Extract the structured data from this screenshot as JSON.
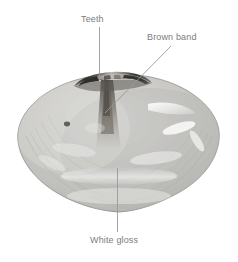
{
  "figure": {
    "background_color": "#ffffff",
    "annotation_text_color": "#7c7c7c",
    "leader_line_color": "#9a9a9a",
    "shell_colors": {
      "body_light": "#d9d9d7",
      "body_mid": "#bdbdba",
      "body_shadow": "#a2a29f",
      "gloss_white": "#f4f4f2",
      "brown_band": "#5f5a53",
      "hinge_dark": "#3a3834",
      "rim_edge": "#8e8e8b",
      "dark_spot": "#4a4a48"
    }
  },
  "annotations": [
    {
      "id": "teeth",
      "label": "Teeth",
      "leader": {
        "type": "vertical",
        "x1": 99,
        "y1": 27,
        "x2": 99,
        "y2": 80
      },
      "target": "hinge-teeth-region"
    },
    {
      "id": "brown-band",
      "label": "Brown band",
      "leader": {
        "type": "diagonal",
        "x1": 171,
        "y1": 46,
        "x2": 105,
        "y2": 113
      },
      "target": "brown-band-region"
    },
    {
      "id": "white-gloss",
      "label": "White gloss",
      "leader": {
        "type": "vertical",
        "x1": 117,
        "y1": 168,
        "x2": 117,
        "y2": 232
      },
      "target": "white-gloss-region"
    }
  ]
}
